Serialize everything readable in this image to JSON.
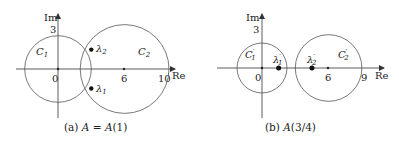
{
  "panels": [
    {
      "id": "a",
      "caption": "(a) A = A(1)",
      "caption_parts": {
        "prefix": "(a) ",
        "lhs": "A",
        "eq": " = ",
        "rhs": "A",
        "arg": "(1)"
      },
      "axis_labels": {
        "x": "Re",
        "y": "Im"
      },
      "ticks": {
        "origin": "0",
        "y_tick": "3",
        "x_ticks": [
          "6",
          "10"
        ]
      },
      "x_tick_values": [
        6,
        10
      ],
      "y_tick_value": 3,
      "circles": [
        {
          "name": "C1",
          "label": "C",
          "sub": "1",
          "center": [
            0,
            0
          ],
          "radius": 3
        },
        {
          "name": "C2",
          "label": "C",
          "sub": "2",
          "center": [
            6,
            0
          ],
          "radius": 4
        }
      ],
      "eigenvalues": [
        {
          "label": "λ",
          "sub": "1",
          "re": 3,
          "im": -1.75
        },
        {
          "label": "λ",
          "sub": "2",
          "re": 3,
          "im": 1.75
        }
      ]
    },
    {
      "id": "b",
      "caption": "(b) A(3/4)",
      "caption_parts": {
        "prefix": "(b) ",
        "rhs": "A",
        "arg": "(3/4)"
      },
      "axis_labels": {
        "x": "Re",
        "y": "Im"
      },
      "ticks": {
        "origin": "0",
        "y_tick": "3",
        "x_ticks": [
          "6",
          "9"
        ]
      },
      "x_tick_values": [
        6,
        9
      ],
      "y_tick_value": 3,
      "circles": [
        {
          "name": "C1'",
          "label": "C",
          "prime": "′",
          "sub": "1",
          "center": [
            0,
            0
          ],
          "radius": 2.25
        },
        {
          "name": "C2'",
          "label": "C",
          "prime": "′",
          "sub": "2",
          "center": [
            6,
            0
          ],
          "radius": 3
        }
      ],
      "eigenvalues": [
        {
          "label": "λ",
          "prime": "′",
          "sub": "1",
          "re": 1.5,
          "im": 0
        },
        {
          "label": "λ",
          "prime": "′",
          "sub": "2",
          "re": 4.5,
          "im": 0
        }
      ]
    }
  ]
}
